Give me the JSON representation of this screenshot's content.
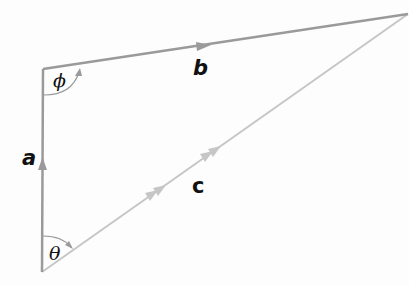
{
  "diagram": {
    "type": "vector-triangle",
    "vertices": {
      "origin": [
        42,
        272
      ],
      "top_left": [
        43,
        69
      ],
      "top_right": [
        408,
        14
      ]
    },
    "colors": {
      "vector_a": "#9a9a9a",
      "vector_b": "#9a9a9a",
      "vector_c": "#c6c6c6",
      "arc": "#9a9a9a",
      "label": "#111111"
    },
    "vectors": [
      {
        "id": "a",
        "label": "a",
        "from": "origin",
        "to": "top_left",
        "arrows": 1
      },
      {
        "id": "b",
        "label": "b",
        "from": "top_left",
        "to": "top_right",
        "arrows": 1
      },
      {
        "id": "c",
        "label": "c",
        "from": "origin",
        "to": "top_right",
        "arrows": 2
      }
    ],
    "angles": [
      {
        "id": "phi",
        "symbol": "ϕ",
        "at": "top_left",
        "between": [
          "a",
          "b"
        ]
      },
      {
        "id": "theta",
        "symbol": "θ",
        "at": "origin",
        "between": [
          "a",
          "c"
        ]
      }
    ]
  }
}
